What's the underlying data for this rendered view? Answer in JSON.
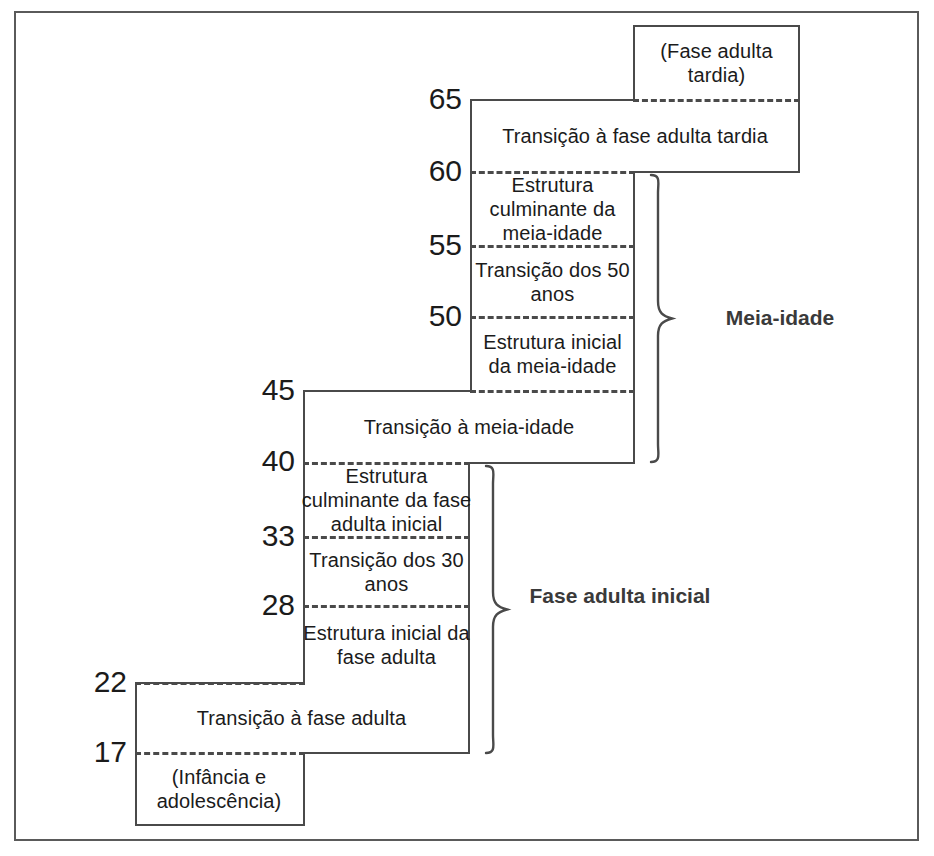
{
  "diagram": {
    "language": "pt-BR",
    "frame_color": "#5a5a5a",
    "line_color": "#4a4a4a",
    "text_color": "#1b1b1b"
  },
  "age_markers": [
    {
      "value": "65",
      "y": 99
    },
    {
      "value": "60",
      "y": 171
    },
    {
      "value": "55",
      "y": 245
    },
    {
      "value": "50",
      "y": 316
    },
    {
      "value": "45",
      "y": 390
    },
    {
      "value": "40",
      "y": 461
    },
    {
      "value": "33",
      "y": 536
    },
    {
      "value": "28",
      "y": 605
    },
    {
      "value": "22",
      "y": 682
    },
    {
      "value": "17",
      "y": 752
    }
  ],
  "stages": [
    {
      "id": "late-adulthood",
      "label": "(Fase adulta tardia)",
      "range": "65+"
    },
    {
      "id": "late-adult-transition",
      "label": "Transição à fase adulta tardia",
      "range": "60-65"
    },
    {
      "id": "culminating-middle",
      "label": "Estrutura culminante da meia-idade",
      "range": "55-60"
    },
    {
      "id": "fifties-transition",
      "label": "Transição dos 50 anos",
      "range": "50-55"
    },
    {
      "id": "entry-middle",
      "label": "Estrutura inicial da meia-idade",
      "range": "45-50"
    },
    {
      "id": "midlife-transition",
      "label": "Transição à meia-idade",
      "range": "40-45"
    },
    {
      "id": "culminating-early",
      "label": "Estrutura culminante da fase adulta inicial",
      "range": "33-40"
    },
    {
      "id": "thirties-transition",
      "label": "Transição dos 30 anos",
      "range": "28-33"
    },
    {
      "id": "entry-early",
      "label": "Estrutura inicial da fase adulta",
      "range": "22-28"
    },
    {
      "id": "early-adult-transition",
      "label": "Transição à fase adulta",
      "range": "17-22"
    },
    {
      "id": "childhood",
      "label": "(Infância e adolescência)",
      "range": "0-17"
    }
  ],
  "era_labels": [
    {
      "id": "middle-adulthood",
      "label": "Meia-idade",
      "spans": "40-65"
    },
    {
      "id": "early-adulthood",
      "label": "Fase adulta inicial",
      "spans": "17-45"
    }
  ]
}
